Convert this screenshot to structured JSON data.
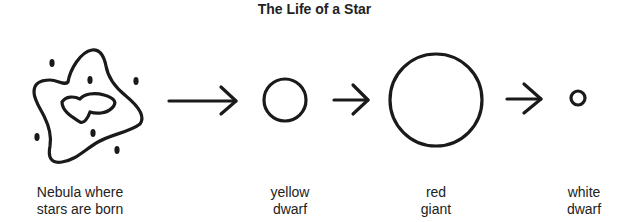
{
  "title": "The Life of a Star",
  "stages": [
    {
      "id": "nebula",
      "shape": "nebula-cloud",
      "label_lines": [
        "Nebula where",
        "stars are born"
      ]
    },
    {
      "id": "yellow-dwarf",
      "shape": "circle-small",
      "label_lines": [
        "yellow",
        "dwarf"
      ]
    },
    {
      "id": "red-giant",
      "shape": "circle-large",
      "label_lines": [
        "red",
        "giant"
      ]
    },
    {
      "id": "white-dwarf",
      "shape": "circle-tiny",
      "label_lines": [
        "white",
        "dwarf"
      ]
    }
  ],
  "arrows": [
    {
      "from": "nebula",
      "to": "yellow-dwarf",
      "icon": "arrow-right-icon"
    },
    {
      "from": "yellow-dwarf",
      "to": "red-giant",
      "icon": "arrow-right-icon"
    },
    {
      "from": "red-giant",
      "to": "white-dwarf",
      "icon": "arrow-right-icon"
    }
  ],
  "colors": {
    "stroke": "#1a1a1a",
    "background": "#ffffff",
    "text": "#222222"
  }
}
